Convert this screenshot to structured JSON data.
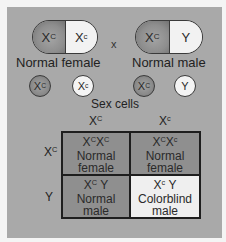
{
  "diagram": {
    "type": "punnett-square",
    "topic": "Sex-linked inheritance of color blindness",
    "colors": {
      "background_panel": "#a9a9a9",
      "carrier_normal_allele_shade": "#8e8e8e",
      "recessive_allele_shade": "#f2f2f2",
      "grid_border": "#1e1e1e"
    },
    "cross_symbol": "x",
    "parents": [
      {
        "label": "Normal female",
        "chromosomes": [
          {
            "base": "X",
            "sup": "C",
            "shade": "dark"
          },
          {
            "base": "X",
            "sup": "c",
            "shade": "light"
          }
        ]
      },
      {
        "label": "Normal male",
        "chromosomes": [
          {
            "base": "X",
            "sup": "C",
            "shade": "dark"
          },
          {
            "base": "Y",
            "sup": "",
            "shade": "light"
          }
        ]
      }
    ],
    "sex_cells_label": "Sex cells",
    "gametes": [
      {
        "base": "X",
        "sup": "C",
        "shade": "dark",
        "parent": "female"
      },
      {
        "base": "X",
        "sup": "c",
        "shade": "light",
        "parent": "female"
      },
      {
        "base": "X",
        "sup": "C",
        "shade": "dark",
        "parent": "male"
      },
      {
        "base": "Y",
        "sup": "",
        "shade": "light",
        "parent": "male"
      }
    ],
    "punnett": {
      "column_headers": [
        {
          "base": "X",
          "sup": "C"
        },
        {
          "base": "X",
          "sup": "c"
        }
      ],
      "row_headers": [
        {
          "base": "X",
          "sup": "C"
        },
        {
          "base": "Y",
          "sup": ""
        }
      ],
      "cells": [
        [
          {
            "genotype": [
              {
                "base": "X",
                "sup": "C"
              },
              {
                "base": "X",
                "sup": "C"
              }
            ],
            "phenotype_line1": "Normal",
            "phenotype_line2": "female",
            "shade": "dark"
          },
          {
            "genotype": [
              {
                "base": "X",
                "sup": "C"
              },
              {
                "base": "X",
                "sup": "c"
              }
            ],
            "phenotype_line1": "Normal",
            "phenotype_line2": "female",
            "shade": "dark"
          }
        ],
        [
          {
            "genotype": [
              {
                "base": "X",
                "sup": "C"
              },
              {
                "base": " Y",
                "sup": ""
              }
            ],
            "phenotype_line1": "Normal",
            "phenotype_line2": "male",
            "shade": "dark"
          },
          {
            "genotype": [
              {
                "base": "X",
                "sup": "c"
              },
              {
                "base": " Y",
                "sup": ""
              }
            ],
            "phenotype_line1": "Colorblind",
            "phenotype_line2": "male",
            "shade": "light"
          }
        ]
      ]
    }
  }
}
